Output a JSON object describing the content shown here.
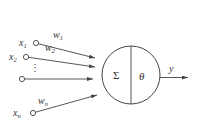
{
  "diagram": {
    "title": "",
    "colors": {
      "stroke": "#444444",
      "text": "#333333",
      "background": "#ffffff"
    },
    "inputs": [
      {
        "var": "x",
        "sub": "1",
        "weight_var": "w",
        "weight_sub": "1"
      },
      {
        "var": "x",
        "sub": "2",
        "weight_var": "w",
        "weight_sub": "2"
      },
      {
        "var": "",
        "sub": "",
        "weight_var": "",
        "weight_sub": ""
      },
      {
        "var": "x",
        "sub": "n",
        "weight_var": "w",
        "weight_sub": "n"
      }
    ],
    "ellipsis": "⋮",
    "neuron": {
      "sum_symbol": "Σ",
      "threshold_symbol": "θ"
    },
    "output": {
      "label": "y"
    }
  }
}
